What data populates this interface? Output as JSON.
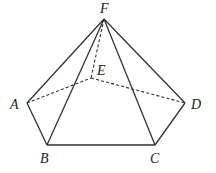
{
  "diagram": {
    "type": "pentagonal-pyramid",
    "vertices": {
      "F": {
        "label": "F",
        "x": 104,
        "y": 19,
        "lx": 100,
        "ly": 13
      },
      "E": {
        "label": "E",
        "x": 91,
        "y": 78,
        "lx": 97,
        "ly": 75
      },
      "A": {
        "label": "A",
        "x": 27,
        "y": 103,
        "lx": 10,
        "ly": 109
      },
      "D": {
        "label": "D",
        "x": 185,
        "y": 103,
        "lx": 191,
        "ly": 109
      },
      "B": {
        "label": "B",
        "x": 47,
        "y": 145,
        "lx": 40,
        "ly": 163
      },
      "C": {
        "label": "C",
        "x": 155,
        "y": 145,
        "lx": 150,
        "ly": 163
      }
    },
    "solid_edges": [
      [
        "F",
        "A"
      ],
      [
        "F",
        "B"
      ],
      [
        "F",
        "C"
      ],
      [
        "F",
        "D"
      ],
      [
        "A",
        "B"
      ],
      [
        "B",
        "C"
      ],
      [
        "C",
        "D"
      ]
    ],
    "hidden_edges": [
      [
        "F",
        "E"
      ],
      [
        "A",
        "E"
      ],
      [
        "E",
        "D"
      ]
    ]
  }
}
